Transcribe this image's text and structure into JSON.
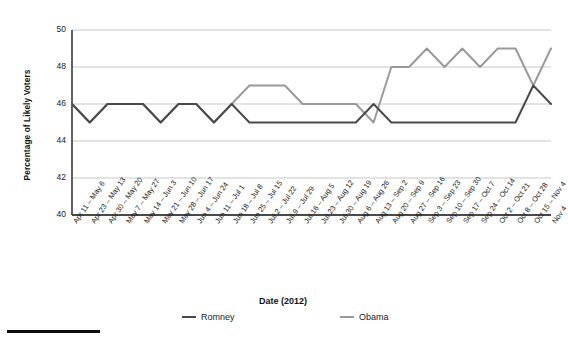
{
  "chart_data": {
    "type": "line",
    "title": "",
    "xlabel": "Date (2012)",
    "ylabel": "Percentage of Likely Voters",
    "ylim": [
      40,
      50
    ],
    "yticks": [
      40,
      42,
      44,
      46,
      48,
      50
    ],
    "grid": "horizontal",
    "legend_position": "bottom",
    "categories": [
      "Apr 11 – May 6",
      "Apr 23 – May 13",
      "Apr 30 – May 20",
      "May 7 – May 27",
      "May 14 – Jun 3",
      "May 21 – Jun 10",
      "May 28 – Jun 17",
      "Jun 4 – Jun 24",
      "Jun 11 – Jul 1",
      "Jun 18 – Jul 8",
      "Jun 25 – Jul 15",
      "Jul 2 – Jul 22",
      "Jul 9 – Jul 29",
      "Jul 16 – Aug 5",
      "Jul 23 – Aug 12",
      "Jul 30 – Aug 19",
      "Aug 6 – Aug 26",
      "Aug 13 – Sep 2",
      "Aug 20 – Sep 9",
      "Aug 27 – Sep 16",
      "Sep 3 – Sep 23",
      "Sep 10 – Sep 30",
      "Sep 17 – Oct 7",
      "Sep 24 – Oct 14",
      "Oct 2 – Oct 21",
      "Oct 8 – Oct 28",
      "Oct 15 – Nov 4",
      "Nov 4"
    ],
    "series": [
      {
        "name": "Romney",
        "color": "#4a4a4a",
        "values": [
          46,
          45,
          46,
          46,
          46,
          45,
          46,
          46,
          45,
          46,
          45,
          45,
          45,
          45,
          45,
          45,
          45,
          46,
          45,
          45,
          45,
          45,
          45,
          45,
          45,
          45,
          47,
          46
        ]
      },
      {
        "name": "Obama",
        "color": "#9a9a9a",
        "values": [
          46,
          45,
          46,
          46,
          46,
          45,
          46,
          46,
          45,
          46,
          47,
          47,
          47,
          46,
          46,
          46,
          46,
          45,
          48,
          48,
          49,
          48,
          49,
          48,
          49,
          49,
          47,
          49
        ]
      }
    ]
  },
  "legend": {
    "items": [
      {
        "label": "Romney",
        "color": "#4a4a4a"
      },
      {
        "label": "Obama",
        "color": "#9a9a9a"
      }
    ]
  },
  "axes": {
    "y_title": "Percentage of Likely Voters",
    "x_title": "Date (2012)",
    "y_tick_labels": [
      "50",
      "48",
      "46",
      "44",
      "42",
      "40"
    ]
  }
}
